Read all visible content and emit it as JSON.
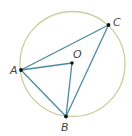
{
  "diagram": {
    "type": "inscribed-angle-circle",
    "center_label": "O",
    "points": [
      {
        "id": "A",
        "label": "A"
      },
      {
        "id": "B",
        "label": "B"
      },
      {
        "id": "C",
        "label": "C"
      },
      {
        "id": "O",
        "label": "O"
      }
    ],
    "segments": [
      {
        "from": "A",
        "to": "C"
      },
      {
        "from": "A",
        "to": "B"
      },
      {
        "from": "B",
        "to": "C"
      },
      {
        "from": "A",
        "to": "O"
      },
      {
        "from": "O",
        "to": "B"
      }
    ],
    "colors": {
      "circle": "#c9ce9e",
      "segment": "#4b8aa0",
      "point": "#111111",
      "label": "#444444"
    }
  }
}
